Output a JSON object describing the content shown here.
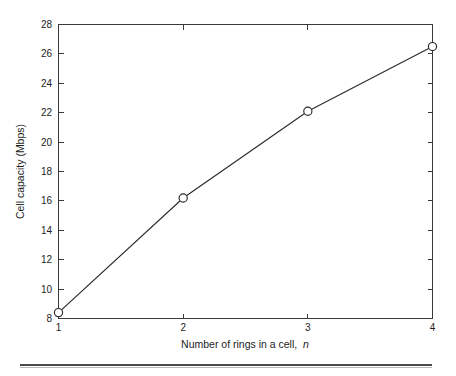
{
  "chart_data": {
    "type": "line",
    "title": "",
    "xlabel": "Number of rings in a cell, n",
    "xlabel_plain": "Number of rings in a cell,",
    "xlabel_italic": "n",
    "ylabel": "Cell capacity (Mbps)",
    "x": [
      1,
      2,
      3,
      4
    ],
    "values": [
      8.4,
      16.2,
      22.1,
      26.5
    ],
    "series": [
      {
        "name": "Cell capacity",
        "values": [
          8.4,
          16.2,
          22.1,
          26.5
        ]
      }
    ],
    "xlim": [
      1,
      4
    ],
    "ylim": [
      8,
      28
    ],
    "xticks": [
      1,
      2,
      3,
      4
    ],
    "xtick_labels": [
      "1",
      "2",
      "3",
      "4"
    ],
    "yticks": [
      8,
      10,
      12,
      14,
      16,
      18,
      20,
      22,
      24,
      26,
      28
    ],
    "ytick_labels": [
      "8",
      "10",
      "12",
      "14",
      "16",
      "18",
      "20",
      "22",
      "24",
      "26",
      "28"
    ],
    "grid": false,
    "legend": null,
    "marker": "open-circle",
    "line_color": "#2b2b2b",
    "marker_face_color": "#ffffff",
    "axis_color": "#3a3a3a",
    "background_color": "#ffffff"
  },
  "figure": {
    "footer_rule_visible": true
  }
}
